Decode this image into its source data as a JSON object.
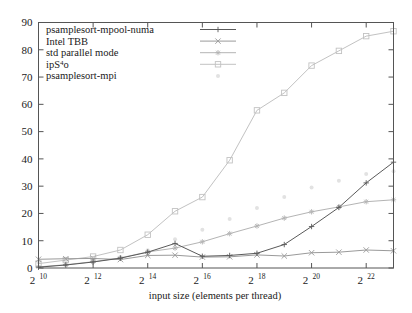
{
  "chart_data": {
    "type": "line",
    "title": "",
    "xlabel": "input size (elements per thread)",
    "ylabel": "",
    "xscale": "log2",
    "x_exponents": [
      10,
      11,
      12,
      13,
      14,
      15,
      16,
      17,
      18,
      19,
      20,
      21,
      22,
      23
    ],
    "x_tick_exponents": [
      10,
      12,
      14,
      16,
      18,
      20,
      22
    ],
    "x_tick_labels": [
      "2^10",
      "2^12",
      "2^14",
      "2^16",
      "2^18",
      "2^20",
      "2^22"
    ],
    "xlim_exponent": [
      10,
      23
    ],
    "ylim": [
      0,
      90
    ],
    "y_ticks": [
      0,
      10,
      20,
      30,
      40,
      50,
      60,
      70,
      80,
      90
    ],
    "y_tick_labels": [
      "0",
      "10",
      "20",
      "30",
      "40",
      "50",
      "60",
      "70",
      "80",
      "90"
    ],
    "grid": false,
    "legend_position": "top-left-inside",
    "series": [
      {
        "name": "psamplesort-mpool-numa",
        "marker": "plus",
        "color": "#5a5a5a",
        "has_line": true,
        "values": [
          0.3,
          1.1,
          2.2,
          3.6,
          5.8,
          9.0,
          4.3,
          4.6,
          5.4,
          8.6,
          15.2,
          22.2,
          31.2,
          38.8
        ]
      },
      {
        "name": "Intel TBB",
        "marker": "cross",
        "color": "#9a9a9a",
        "has_line": true,
        "values": [
          3.2,
          3.4,
          3.5,
          3.1,
          4.6,
          4.7,
          4.0,
          4.1,
          4.8,
          4.4,
          5.6,
          5.8,
          6.6,
          6.3
        ]
      },
      {
        "name": "std parallel mode",
        "marker": "star",
        "color": "#b4b4b4",
        "has_line": true,
        "values": [
          0.4,
          1.2,
          2.3,
          3.7,
          5.9,
          7.3,
          9.6,
          12.6,
          15.4,
          18.3,
          20.6,
          22.4,
          24.3,
          25.0
        ]
      },
      {
        "name": "ipS4o",
        "marker": "square",
        "color": "#c2c2c2",
        "has_line": true,
        "values": [
          1.6,
          2.9,
          4.2,
          6.6,
          12.2,
          20.8,
          26.0,
          39.5,
          57.8,
          64.2,
          74.2,
          79.6,
          85.0,
          86.8
        ]
      },
      {
        "name": "psamplesort-mpi",
        "marker": "dot",
        "color": "#e2e2e2",
        "has_line": false,
        "values": [
          2.0,
          2.3,
          3.0,
          4.0,
          6.5,
          10.5,
          14.0,
          18.0,
          22.0,
          26.0,
          29.5,
          32.0,
          34.5,
          35.5
        ]
      }
    ]
  },
  "legend": {
    "entries": [
      {
        "label": "psamplesort-mpool-numa",
        "marker": "plus"
      },
      {
        "label": "Intel TBB",
        "marker": "cross"
      },
      {
        "label": "std parallel mode",
        "marker": "star"
      },
      {
        "label": "ipS",
        "superscript": "4",
        "label_tail": "o",
        "marker": "square"
      },
      {
        "label": "psamplesort-mpi",
        "marker": "dot"
      }
    ]
  },
  "axis": {
    "x_title": "input size (elements per thread)",
    "x_base": "2"
  }
}
